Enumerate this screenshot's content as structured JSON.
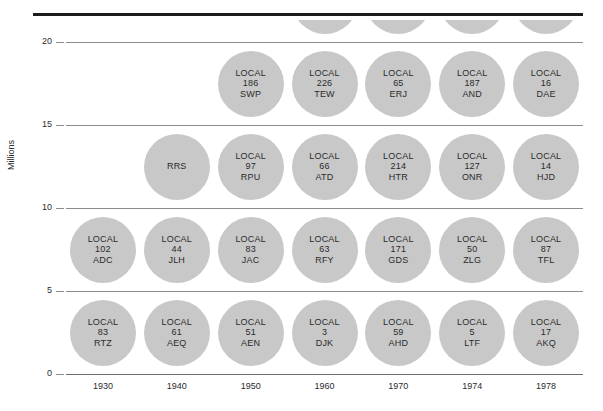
{
  "chart_data": {
    "type": "scatter",
    "title": "",
    "xlabel": "",
    "ylabel": "Millions",
    "ylim": [
      0,
      20
    ],
    "y_ticks": [
      0,
      5,
      10,
      15,
      20
    ],
    "x_ticks": [
      "1930",
      "1940",
      "1950",
      "1960",
      "1970",
      "1974",
      "1978"
    ],
    "grid": true,
    "legend": "none",
    "bubble_label_prefix": "LOCAL",
    "note": "Each column stacks equal-size circles; each circle is centered between gridlines at y = 2.5, 7.5, 12.5, 17.5 and 22.5 (the 22.5 row is clipped by the top edge).",
    "columns": [
      {
        "x": "1930",
        "bubbles": [
          {
            "y": 2.5,
            "prefix": "LOCAL",
            "number": "83",
            "code": "RTZ",
            "clipped": false
          },
          {
            "y": 7.5,
            "prefix": "LOCAL",
            "number": "102",
            "code": "ADC",
            "clipped": false
          }
        ]
      },
      {
        "x": "1940",
        "bubbles": [
          {
            "y": 2.5,
            "prefix": "LOCAL",
            "number": "61",
            "code": "AEQ",
            "clipped": false
          },
          {
            "y": 7.5,
            "prefix": "LOCAL",
            "number": "44",
            "code": "JLH",
            "clipped": false
          },
          {
            "y": 12.5,
            "prefix": "",
            "number": "",
            "code": "RRS",
            "clipped": true
          }
        ]
      },
      {
        "x": "1950",
        "bubbles": [
          {
            "y": 2.5,
            "prefix": "LOCAL",
            "number": "51",
            "code": "AEN",
            "clipped": false
          },
          {
            "y": 7.5,
            "prefix": "LOCAL",
            "number": "83",
            "code": "JAC",
            "clipped": false
          },
          {
            "y": 12.5,
            "prefix": "LOCAL",
            "number": "97",
            "code": "RPU",
            "clipped": false
          },
          {
            "y": 17.5,
            "prefix": "LOCAL",
            "number": "186",
            "code": "SWP",
            "clipped": false
          }
        ]
      },
      {
        "x": "1960",
        "bubbles": [
          {
            "y": 2.5,
            "prefix": "LOCAL",
            "number": "3",
            "code": "DJK",
            "clipped": false
          },
          {
            "y": 7.5,
            "prefix": "LOCAL",
            "number": "63",
            "code": "RFY",
            "clipped": false
          },
          {
            "y": 12.5,
            "prefix": "LOCAL",
            "number": "66",
            "code": "ATD",
            "clipped": false
          },
          {
            "y": 17.5,
            "prefix": "LOCAL",
            "number": "226",
            "code": "TEW",
            "clipped": false
          },
          {
            "y": 22.5,
            "prefix": "LOCAL",
            "number": "28",
            "code": "CCS",
            "clipped": false
          }
        ]
      },
      {
        "x": "1970",
        "bubbles": [
          {
            "y": 2.5,
            "prefix": "LOCAL",
            "number": "59",
            "code": "AHD",
            "clipped": false
          },
          {
            "y": 7.5,
            "prefix": "LOCAL",
            "number": "171",
            "code": "GDS",
            "clipped": false
          },
          {
            "y": 12.5,
            "prefix": "LOCAL",
            "number": "214",
            "code": "HTR",
            "clipped": false
          },
          {
            "y": 17.5,
            "prefix": "LOCAL",
            "number": "65",
            "code": "ERJ",
            "clipped": false
          },
          {
            "y": 22.5,
            "prefix": "LOCAL",
            "number": "4",
            "code": "YGS",
            "clipped": true
          }
        ]
      },
      {
        "x": "1974",
        "bubbles": [
          {
            "y": 2.5,
            "prefix": "LOCAL",
            "number": "5",
            "code": "LTF",
            "clipped": false
          },
          {
            "y": 7.5,
            "prefix": "LOCAL",
            "number": "50",
            "code": "ZLG",
            "clipped": false
          },
          {
            "y": 12.5,
            "prefix": "LOCAL",
            "number": "127",
            "code": "ONR",
            "clipped": false
          },
          {
            "y": 17.5,
            "prefix": "LOCAL",
            "number": "187",
            "code": "AND",
            "clipped": false
          },
          {
            "y": 22.5,
            "prefix": "LOCAL",
            "number": "2",
            "code": "FRA",
            "clipped": false
          },
          {
            "y": 27.5,
            "prefix": "LOCAL",
            "number": "31",
            "code": "STC",
            "clipped": true
          }
        ]
      },
      {
        "x": "1978",
        "bubbles": [
          {
            "y": 2.5,
            "prefix": "LOCAL",
            "number": "17",
            "code": "AKQ",
            "clipped": false
          },
          {
            "y": 7.5,
            "prefix": "LOCAL",
            "number": "87",
            "code": "TFL",
            "clipped": false
          },
          {
            "y": 12.5,
            "prefix": "LOCAL",
            "number": "14",
            "code": "HJD",
            "clipped": false
          },
          {
            "y": 17.5,
            "prefix": "LOCAL",
            "number": "16",
            "code": "DAE",
            "clipped": false
          },
          {
            "y": 22.5,
            "prefix": "LOCAL",
            "number": "15",
            "code": "EAN",
            "clipped": false
          },
          {
            "y": 27.5,
            "prefix": "LOCAL",
            "number": "38",
            "code": "RZT",
            "clipped": true
          }
        ]
      }
    ]
  },
  "colors": {
    "bubble_fill": "#c8c8c8",
    "text": "#2b2b2b",
    "gridline": "#8d8d8d",
    "top_rule": "#1c1c1c",
    "background": "#ffffff"
  }
}
